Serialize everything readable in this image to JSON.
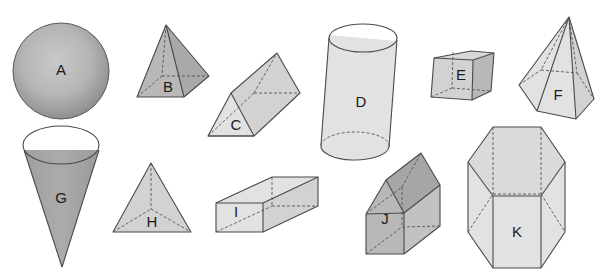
{
  "diagram": {
    "type": "geometric-solids",
    "background": "#ffffff",
    "shapes": [
      {
        "id": "A",
        "label": "A",
        "name": "sphere"
      },
      {
        "id": "B",
        "label": "B",
        "name": "square pyramid"
      },
      {
        "id": "C",
        "label": "C",
        "name": "triangular prism"
      },
      {
        "id": "D",
        "label": "D",
        "name": "cylinder"
      },
      {
        "id": "E",
        "label": "E",
        "name": "cube"
      },
      {
        "id": "F",
        "label": "F",
        "name": "pentagonal pyramid"
      },
      {
        "id": "G",
        "label": "G",
        "name": "cone"
      },
      {
        "id": "H",
        "label": "H",
        "name": "triangular pyramid"
      },
      {
        "id": "I",
        "label": "I",
        "name": "rectangular prism"
      },
      {
        "id": "J",
        "label": "J",
        "name": "pentagonal prism"
      },
      {
        "id": "K",
        "label": "K",
        "name": "hexagonal prism"
      }
    ],
    "colors": {
      "edge": "#4a4a4a",
      "face_light": "#e2e2e2",
      "face_mid": "#d2d2d2",
      "face_dark": "#b8b8b8",
      "face_darker": "#a9a9a9"
    }
  }
}
